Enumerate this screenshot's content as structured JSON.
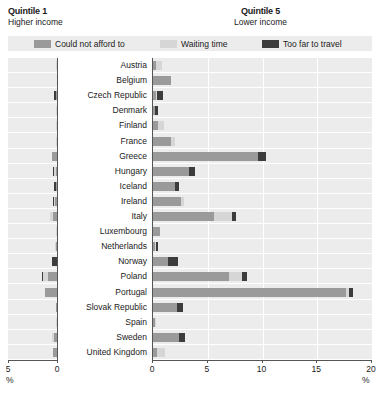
{
  "header": {
    "left_title": "Quintile 1",
    "left_subtitle": "Higher income",
    "right_title": "Quintile 5",
    "right_subtitle": "Lower income"
  },
  "legend": [
    {
      "label": "Could not afford to",
      "color": "#9a9a9a",
      "key": "could_not_afford"
    },
    {
      "label": "Waiting time",
      "color": "#d6d6d6",
      "key": "waiting_time"
    },
    {
      "label": "Too far to travel",
      "color": "#3c3c3c",
      "key": "too_far"
    }
  ],
  "axes": {
    "left": {
      "label": "%",
      "ticks": [
        "5",
        "0"
      ],
      "min": 0,
      "max": 5,
      "reversed": true
    },
    "right": {
      "label": "%",
      "ticks": [
        "0",
        "5",
        "10",
        "15",
        "20"
      ],
      "min": 0,
      "max": 20,
      "reversed": false
    }
  },
  "chart_data": {
    "type": "bar",
    "orientation": "horizontal",
    "stacked": true,
    "xlabel": "%",
    "ylabel": "",
    "grid": true,
    "legend_position": "top",
    "series_names": [
      "Could not afford to",
      "Waiting time",
      "Too far to travel"
    ],
    "panels": [
      {
        "name": "Quintile 1",
        "subtitle": "Higher income",
        "xlim": [
          0,
          5
        ],
        "direction": "right-to-left"
      },
      {
        "name": "Quintile 5",
        "subtitle": "Lower income",
        "xlim": [
          0,
          20
        ],
        "direction": "left-to-right"
      }
    ],
    "categories": [
      "Austria",
      "Belgium",
      "Czech Republic",
      "Denmark",
      "Finland",
      "France",
      "Greece",
      "Hungary",
      "Iceland",
      "Ireland",
      "Italy",
      "Luxembourg",
      "Netherlands",
      "Norway",
      "Poland",
      "Portugal",
      "Slovak Republic",
      "Spain",
      "Sweden",
      "United Kingdom"
    ],
    "quintile1": {
      "could_not_afford": [
        0.0,
        0.0,
        0.1,
        0.0,
        0.0,
        0.0,
        0.5,
        0.15,
        0.05,
        0.2,
        0.45,
        0.0,
        0.05,
        0.0,
        0.9,
        1.2,
        0.05,
        0.0,
        0.35,
        0.4
      ],
      "waiting_time": [
        0.1,
        0.0,
        0.0,
        0.05,
        0.1,
        0.05,
        0.0,
        0.1,
        0.0,
        0.1,
        0.3,
        0.1,
        0.05,
        0.0,
        0.5,
        0.0,
        0.0,
        0.05,
        0.2,
        0.0
      ],
      "too_far": [
        0.0,
        0.0,
        0.15,
        0.0,
        0.0,
        0.0,
        0.0,
        0.05,
        0.2,
        0.1,
        0.0,
        0.0,
        0.0,
        0.55,
        0.15,
        0.0,
        0.0,
        0.0,
        0.0,
        0.0
      ]
    },
    "quintile5": {
      "could_not_afford": [
        0.3,
        1.6,
        0.3,
        0.2,
        0.5,
        1.6,
        9.6,
        3.3,
        2.0,
        2.6,
        5.6,
        0.6,
        0.2,
        1.4,
        6.9,
        17.6,
        2.2,
        0.2,
        2.4,
        0.4
      ],
      "waiting_time": [
        0.5,
        0.0,
        0.1,
        0.0,
        0.5,
        0.4,
        0.0,
        0.0,
        0.0,
        0.2,
        1.6,
        0.0,
        0.1,
        0.0,
        1.2,
        0.3,
        0.0,
        0.1,
        0.0,
        0.7
      ],
      "too_far": [
        0.0,
        0.0,
        0.5,
        0.3,
        0.0,
        0.0,
        0.7,
        0.5,
        0.4,
        0.0,
        0.4,
        0.0,
        0.1,
        0.9,
        0.5,
        0.4,
        0.5,
        0.0,
        0.5,
        0.0
      ]
    }
  }
}
